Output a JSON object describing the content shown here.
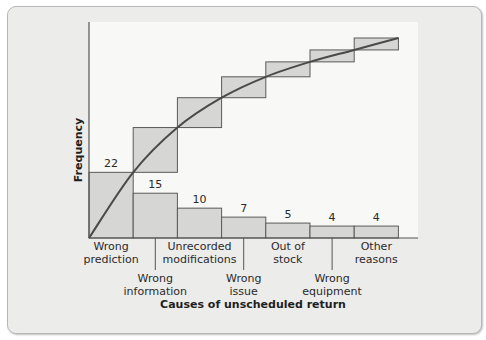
{
  "chart_data": {
    "type": "bar",
    "title": "",
    "xlabel": "Causes of unscheduled return",
    "ylabel": "Frequency",
    "categories": [
      "Wrong prediction",
      "Wrong information",
      "Unrecorded modifications",
      "Wrong issue",
      "Out of stock",
      "Wrong equipment",
      "Other reasons"
    ],
    "category_lines": [
      [
        "Wrong",
        "prediction"
      ],
      [
        "Wrong",
        "information"
      ],
      [
        "Unrecorded",
        "modifications"
      ],
      [
        "Wrong",
        "issue"
      ],
      [
        "Out of",
        "stock"
      ],
      [
        "Wrong",
        "equipment"
      ],
      [
        "Other",
        "reasons"
      ]
    ],
    "values": [
      22,
      15,
      10,
      7,
      5,
      4,
      4
    ],
    "data_labels": [
      "22",
      "15",
      "10",
      "7",
      "5",
      "4",
      "4"
    ],
    "cumulative": [
      22,
      37,
      47,
      54,
      59,
      63,
      67
    ],
    "ylim": [
      0,
      70
    ],
    "grid": false,
    "legend": "none",
    "overlay": "cumulative frequency curve with stepped cumulative boxes (Pareto chart)",
    "colors": {
      "bar_fill": "#d6d6d4",
      "bar_stroke": "#5a5a5a",
      "curve": "#4a4a4a",
      "plot_bg": "#f8f8f6",
      "frame_bg": "#ececea"
    }
  }
}
